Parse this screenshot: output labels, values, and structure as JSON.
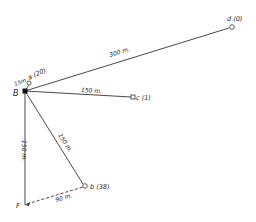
{
  "diagram": {
    "points": {
      "B": {
        "label": "B",
        "x": 25,
        "y": 91
      },
      "a": {
        "label": "a (20)",
        "x": 29,
        "y": 84
      },
      "d": {
        "label": "d (0)",
        "x": 232,
        "y": 27
      },
      "c": {
        "label": "c (1)",
        "x": 133,
        "y": 97
      },
      "b": {
        "label": "b (38)",
        "x": 85,
        "y": 186
      },
      "F": {
        "label": "F",
        "x": 25,
        "y": 205
      }
    },
    "distances": {
      "B_a": "15m",
      "B_d": "300 m.",
      "B_c": "150 m.",
      "B_b": "150 m.",
      "B_F": "150 m.",
      "F_b": "90 m."
    },
    "colors": {
      "line": "#333333",
      "text": "#222222"
    }
  }
}
